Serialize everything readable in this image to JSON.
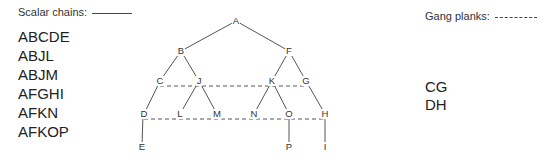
{
  "legend": {
    "scalar_label": "Scalar chains:",
    "gang_label": "Gang planks:"
  },
  "scalar_chains": [
    "ABCDE",
    "ABJL",
    "ABJM",
    "AFGHI",
    "AFKN",
    "AFKOP"
  ],
  "gang_planks": [
    "CG",
    "DH"
  ],
  "nodes": {
    "A": "A",
    "B": "B",
    "F": "F",
    "C": "C",
    "J": "J",
    "K": "K",
    "G": "G",
    "D": "D",
    "L": "L",
    "M": "M",
    "N": "N",
    "O": "O",
    "H": "H",
    "E": "E",
    "P": "P",
    "I": "I"
  },
  "colors": {
    "line": "#555555",
    "text": "#222222"
  }
}
